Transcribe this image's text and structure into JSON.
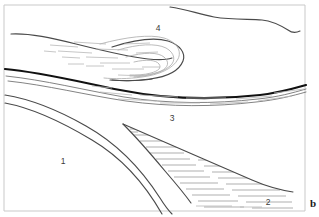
{
  "figure": {
    "background_color": "#ffffff",
    "frame_color": "#c9c9c9",
    "line_color_major": "#111111",
    "line_color_medium": "#4a4a4a",
    "line_color_light": "#a9a9a9",
    "hatch_color": "#a0a0a0",
    "width": 319,
    "height": 217
  },
  "labels": {
    "unit_1": "1",
    "unit_2": "2",
    "unit_3": "3",
    "unit_4": "4",
    "edge_mark": "b"
  },
  "label_positions": {
    "unit_1": {
      "x": 63,
      "y": 162
    },
    "unit_2": {
      "x": 268,
      "y": 203
    },
    "unit_3": {
      "x": 172,
      "y": 119
    },
    "unit_4": {
      "x": 158,
      "y": 29
    }
  },
  "geometry": {
    "frame": "M 4 5 L 305 5 L 305 211 L 4 211 Z",
    "topo_surface": "M 170 7 C 186 9 198 14 214 17 C 232 20 248 19 262 20 C 272 21 280 25 288 30 C 292 33 296 33 300 31",
    "upper_contact": "M 11 34 C 28 33 48 38 70 43 C 96 49 122 55 142 58 C 152 60 160 61 167 60",
    "major_contact": "M 5 69 C 40 72 80 82 120 90 C 165 99 215 100 260 95 C 278 93 292 89 306 85",
    "contact_below_major": "M 6 76 C 44 80 84 90 124 97 C 168 104 214 104 258 99 C 278 97 292 93 306 89",
    "contact_lower_a": "M 5 95 C 30 99 58 110 86 125 C 118 142 140 168 160 196 C 166 204 170 209 174 213",
    "contact_lower_b": "M 5 102 C 32 107 62 120 92 137 C 124 156 148 183 166 213",
    "wedge_top": "M 123 124 C 160 140 210 162 252 180 C 268 187 280 190 292 192",
    "wedge_bottom": "M 123 124 C 134 134 150 152 166 170 C 178 184 186 194 192 201",
    "fold_outer": "M 11 34 C 38 35 70 42 104 50 C 132 57 155 62 168 60 C 180 58 186 50 182 42 C 177 32 160 26 140 27",
    "fold_nose_outer": "M 104 50 C 128 39 152 35 168 38 C 182 41 188 48 186 55 C 183 64 170 70 156 73 C 140 76 122 77 110 79",
    "fold_loop_1": "M 118 49 C 140 42 160 40 172 44 C 182 48 184 55 179 60 C 172 67 158 71 144 73",
    "fold_loop_2": "M 128 56 C 146 50 162 49 170 53 C 177 57 177 63 171 67 C 164 72 152 74 142 75",
    "fold_loop_3": "M 136 62 C 150 58 160 58 165 61 C 170 64 169 68 164 70 C 158 73 148 74 140 75"
  },
  "units": [
    {
      "id": "1",
      "description": "lower-left unlabeled block",
      "pattern": "blank"
    },
    {
      "id": "2",
      "description": "lower-right hatched wedge",
      "pattern": "horizontal-dash-hatch"
    },
    {
      "id": "3",
      "description": "thin layer beneath major contact",
      "pattern": "sparse-dash"
    },
    {
      "id": "4",
      "description": "folded hook / recumbent fold nose",
      "pattern": "sparse-dash"
    }
  ]
}
